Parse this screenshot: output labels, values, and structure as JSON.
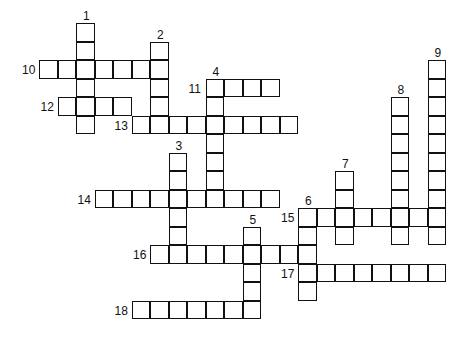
{
  "puzzle": {
    "type": "crossword",
    "grid": {
      "origin_x": 40,
      "origin_y": 24,
      "cell_size": 18.5
    },
    "across": [
      {
        "number": "10",
        "row": 2,
        "col": 0,
        "length": 7
      },
      {
        "number": "11",
        "row": 3,
        "col": 9,
        "length": 4
      },
      {
        "number": "12",
        "row": 4,
        "col": 1,
        "length": 4
      },
      {
        "number": "13",
        "row": 5,
        "col": 5,
        "length": 9
      },
      {
        "number": "14",
        "row": 9,
        "col": 3,
        "length": 10
      },
      {
        "number": "15",
        "row": 10,
        "col": 14,
        "length": 8
      },
      {
        "number": "16",
        "row": 12,
        "col": 6,
        "length": 9
      },
      {
        "number": "17",
        "row": 13,
        "col": 14,
        "length": 8
      },
      {
        "number": "18",
        "row": 15,
        "col": 5,
        "length": 7
      }
    ],
    "down": [
      {
        "number": "1",
        "row": 0,
        "col": 2,
        "length": 6
      },
      {
        "number": "2",
        "row": 1,
        "col": 6,
        "length": 5
      },
      {
        "number": "3",
        "row": 7,
        "col": 7,
        "length": 6
      },
      {
        "number": "4",
        "row": 3,
        "col": 9,
        "length": 7
      },
      {
        "number": "5",
        "row": 11,
        "col": 11,
        "length": 5
      },
      {
        "number": "6",
        "row": 10,
        "col": 14,
        "length": 5
      },
      {
        "number": "7",
        "row": 8,
        "col": 16,
        "length": 4
      },
      {
        "number": "8",
        "row": 4,
        "col": 19,
        "length": 8
      },
      {
        "number": "9",
        "row": 2,
        "col": 21,
        "length": 10
      }
    ]
  }
}
